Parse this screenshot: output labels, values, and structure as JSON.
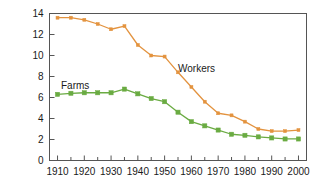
{
  "chart_data": {
    "type": "line",
    "title": "",
    "subtitle": "",
    "xlabel": "",
    "ylabel": "Millions",
    "xlim": [
      1907,
      2003
    ],
    "ylim": [
      0,
      14
    ],
    "grid": false,
    "legend_position": "inline-annotations",
    "x": [
      1910,
      1915,
      1920,
      1925,
      1930,
      1935,
      1940,
      1945,
      1950,
      1955,
      1960,
      1965,
      1970,
      1975,
      1980,
      1985,
      1990,
      1995,
      2000
    ],
    "xticks_major": [
      1910,
      1920,
      1930,
      1940,
      1950,
      1960,
      1970,
      1980,
      1990,
      2000
    ],
    "xticks_minor": [
      1915,
      1925,
      1935,
      1945,
      1955,
      1965,
      1975,
      1985,
      1995
    ],
    "yticks": [
      0,
      2,
      4,
      6,
      8,
      10,
      12,
      14
    ],
    "series": [
      {
        "name": "Workers",
        "color": "#e3933f",
        "marker": "square",
        "annotation": "Workers",
        "values": [
          13.6,
          13.6,
          13.4,
          13.0,
          12.5,
          12.8,
          11.0,
          10.0,
          9.9,
          8.4,
          7.0,
          5.6,
          4.5,
          4.3,
          3.7,
          3.0,
          2.8,
          2.8,
          2.9
        ]
      },
      {
        "name": "Farms",
        "color": "#6aab42",
        "marker": "square",
        "annotation": "Farms",
        "values": [
          6.3,
          6.4,
          6.45,
          6.45,
          6.45,
          6.8,
          6.35,
          5.9,
          5.6,
          4.6,
          3.7,
          3.3,
          2.9,
          2.5,
          2.4,
          2.25,
          2.15,
          2.05,
          2.05
        ]
      }
    ]
  },
  "axis": {
    "ytick_labels": [
      "0",
      "2",
      "4",
      "6",
      "8",
      "10",
      "12",
      "14"
    ],
    "xtick_labels": [
      "1910",
      "1920",
      "1930",
      "1940",
      "1950",
      "1960",
      "1970",
      "1980",
      "1990",
      "2000"
    ],
    "ylabel_text": "Millions"
  },
  "annotations": {
    "workers_label": "Workers",
    "farms_label": "Farms"
  },
  "colors": {
    "workers": "#e3933f",
    "farms": "#6aab42",
    "axis": "#555555",
    "text": "#1a1a1a",
    "background": "#ffffff"
  }
}
